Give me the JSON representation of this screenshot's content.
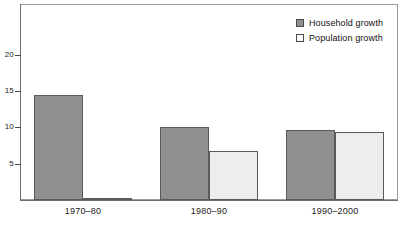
{
  "chart_data": {
    "type": "bar",
    "title": "",
    "subtitle": "",
    "xlabel": "",
    "ylabel": "",
    "categories": [
      "1970–80",
      "1980–90",
      "1990–2000"
    ],
    "series": [
      {
        "name": "Household growth",
        "color": "#909090",
        "values": [
          14.4,
          10.1,
          9.7
        ]
      },
      {
        "name": "Population growth",
        "color": "#ededed",
        "values": [
          0.1,
          6.8,
          9.4
        ]
      }
    ],
    "ylim": [
      0,
      27
    ],
    "yticks": [
      5,
      10,
      15,
      20
    ],
    "ytick_labels": [
      "5",
      "10",
      "15",
      "20"
    ],
    "grid": false,
    "legend_position": "top-right",
    "border": true
  },
  "legend": {
    "items": [
      {
        "label": "Household growth",
        "swatch": "household"
      },
      {
        "label": "Population growth",
        "swatch": "population"
      }
    ]
  },
  "axis": {
    "y_labels": [
      "20",
      "15",
      "10",
      "5"
    ],
    "x_labels": [
      "1970–80",
      "1980–90",
      "1990–2000"
    ]
  },
  "colors": {
    "household": "#909090",
    "population": "#ededed",
    "bar_border": "#5a5a5a",
    "frame": "#9a9a9a",
    "axis": "#6e6e6e",
    "text": "#1a1a1a",
    "background": "#ffffff"
  }
}
